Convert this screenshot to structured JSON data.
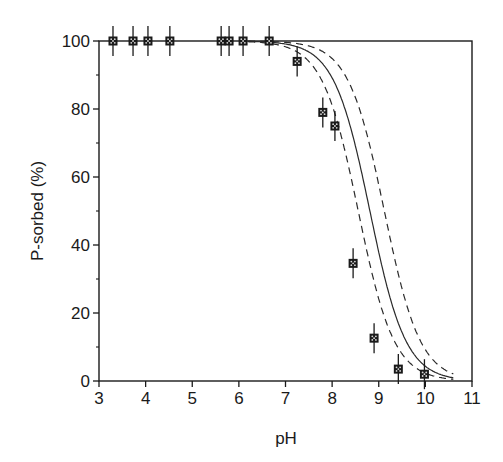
{
  "chart_data": {
    "type": "scatter",
    "title": "",
    "xlabel": "pH",
    "ylabel": "P-sorbed (%)",
    "xlim": [
      3,
      11
    ],
    "ylim": [
      0,
      100
    ],
    "x_ticks": [
      3,
      4,
      5,
      6,
      7,
      8,
      9,
      10,
      11
    ],
    "y_ticks": [
      0,
      20,
      40,
      60,
      80,
      100
    ],
    "y_minor_ticks": [
      10,
      30,
      50,
      70,
      90
    ],
    "grid": false,
    "legend": null,
    "series": [
      {
        "name": "measured",
        "kind": "scatter_with_error_bars",
        "x": [
          3.3,
          3.73,
          4.05,
          4.52,
          5.62,
          5.79,
          6.09,
          6.65,
          7.25,
          7.8,
          8.06,
          8.45,
          8.9,
          9.42,
          9.98
        ],
        "y": [
          100,
          100,
          100,
          100,
          100,
          100,
          100,
          100,
          94,
          79,
          75,
          34.6,
          12.6,
          3.5,
          2
        ],
        "error": 4.5
      },
      {
        "name": "model",
        "kind": "line",
        "style": "solid",
        "midpoint_pH": 8.81,
        "slope": 2.6
      },
      {
        "name": "model lower bound",
        "kind": "line",
        "style": "dashed",
        "midpoint_pH": 8.56,
        "slope": 2.6
      },
      {
        "name": "model upper bound",
        "kind": "line",
        "style": "dashed",
        "midpoint_pH": 9.12,
        "slope": 2.6
      }
    ]
  },
  "colors": {
    "axis": "#1a1a1a",
    "marker_fill": "#1a1a1a",
    "marker_dot": "#d8d8d8",
    "line": "#2a2a2a"
  }
}
